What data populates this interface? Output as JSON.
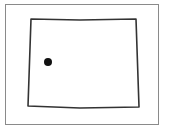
{
  "map": {
    "region": "Wyoming state outline",
    "frame": {
      "x": 5,
      "y": 4,
      "width": 153,
      "height": 120,
      "stroke": "#8a8a8a"
    },
    "outline": {
      "points": [
        [
          31,
          19
        ],
        [
          80,
          20
        ],
        [
          136,
          19
        ],
        [
          139,
          107
        ],
        [
          80,
          108
        ],
        [
          28,
          106
        ]
      ],
      "stroke": "#333333"
    },
    "marker": {
      "cx": 48,
      "cy": 62,
      "r": 4,
      "fill": "#111111"
    }
  }
}
